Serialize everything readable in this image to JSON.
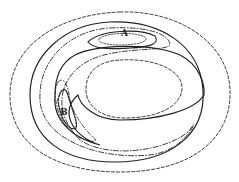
{
  "diagram": {
    "type": "contour",
    "labels": [
      {
        "id": "A",
        "text": "A",
        "x": 124,
        "y": 33
      },
      {
        "id": "B",
        "text": "B",
        "x": 62,
        "y": 112
      }
    ],
    "colors": {
      "line": "#222222",
      "background": "#ffffff"
    }
  }
}
